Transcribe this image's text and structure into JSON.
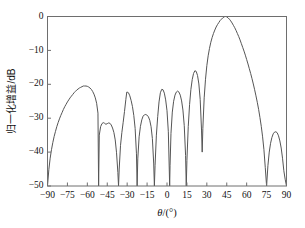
{
  "chart_data": {
    "type": "line",
    "title": "",
    "subtitle": "",
    "xlabel": "θ/(°)",
    "ylabel": "归一化增益/dB",
    "xlim": [
      -90,
      90
    ],
    "ylim": [
      -50,
      0
    ],
    "xticks": [
      -90,
      -75,
      -60,
      -45,
      -30,
      -15,
      0,
      15,
      30,
      45,
      60,
      75,
      90
    ],
    "xticklabels": [
      "−90",
      "−75",
      "−60",
      "−45",
      "−30",
      "−15",
      "0",
      "15",
      "30",
      "45",
      "60",
      "75",
      "90"
    ],
    "yticks": [
      0,
      -10,
      -20,
      -30,
      -40,
      -50
    ],
    "yticklabels": [
      "0",
      "−10",
      "−20",
      "−30",
      "−40",
      "−50"
    ],
    "grid": false,
    "legend": null,
    "line_color": "#555555",
    "axis_color": "#6e6e6e",
    "background": "#ffffff",
    "series": [
      {
        "name": "normalized gain pattern",
        "main_lobe": {
          "peak_x": 43,
          "peak_y": 0,
          "left_null_x": 28,
          "right_null_x": 75
        },
        "sidelobe_peaks": [
          {
            "x": -63,
            "y": -20.5
          },
          {
            "x": -43,
            "y": -31.5
          },
          {
            "x": -30,
            "y": -22.3
          },
          {
            "x": -15.5,
            "y": -29.0
          },
          {
            "x": -4,
            "y": -21.5
          },
          {
            "x": 8,
            "y": -22.0
          },
          {
            "x": 21,
            "y": -16.0
          },
          {
            "x": 82,
            "y": -34.0
          }
        ],
        "nulls": [
          {
            "x": -90,
            "y": -50
          },
          {
            "x": -51.5,
            "y": -50
          },
          {
            "x": -36.5,
            "y": -50
          },
          {
            "x": -22.5,
            "y": -50
          },
          {
            "x": -9.5,
            "y": -50
          },
          {
            "x": 2.0,
            "y": -50
          },
          {
            "x": 14.5,
            "y": -50
          },
          {
            "x": 26.5,
            "y": -40.0
          },
          {
            "x": 75.0,
            "y": -50
          },
          {
            "x": 90.0,
            "y": -50
          }
        ],
        "points": [
          [
            -90,
            -50.0
          ],
          [
            -89,
            -45.2
          ],
          [
            -88,
            -41.8
          ],
          [
            -87,
            -39.3
          ],
          [
            -86,
            -37.2
          ],
          [
            -85,
            -35.4
          ],
          [
            -84,
            -33.9
          ],
          [
            -83,
            -32.5
          ],
          [
            -82,
            -31.3
          ],
          [
            -81,
            -30.2
          ],
          [
            -80,
            -29.2
          ],
          [
            -79,
            -28.3
          ],
          [
            -78,
            -27.4
          ],
          [
            -77,
            -26.6
          ],
          [
            -76,
            -25.9
          ],
          [
            -75,
            -25.2
          ],
          [
            -74,
            -24.6
          ],
          [
            -73,
            -24.0
          ],
          [
            -72,
            -23.5
          ],
          [
            -71,
            -23.0
          ],
          [
            -70,
            -22.5
          ],
          [
            -69,
            -22.1
          ],
          [
            -68,
            -21.7
          ],
          [
            -67,
            -21.4
          ],
          [
            -66,
            -21.1
          ],
          [
            -65,
            -20.9
          ],
          [
            -64,
            -20.7
          ],
          [
            -63,
            -20.5
          ],
          [
            -62,
            -20.5
          ],
          [
            -61,
            -20.5
          ],
          [
            -60,
            -20.6
          ],
          [
            -59,
            -20.8
          ],
          [
            -58,
            -21.1
          ],
          [
            -57,
            -21.5
          ],
          [
            -56,
            -22.1
          ],
          [
            -55,
            -22.9
          ],
          [
            -54,
            -24.0
          ],
          [
            -53,
            -25.6
          ],
          [
            -52,
            -28.5
          ],
          [
            -51.5,
            -50.0
          ],
          [
            -51,
            -35.0
          ],
          [
            -50,
            -32.5
          ],
          [
            -49,
            -31.6
          ],
          [
            -48,
            -31.3
          ],
          [
            -47,
            -31.5
          ],
          [
            -46,
            -31.8
          ],
          [
            -45,
            -31.6
          ],
          [
            -44,
            -31.4
          ],
          [
            -43,
            -31.5
          ],
          [
            -42,
            -32.0
          ],
          [
            -41,
            -32.9
          ],
          [
            -40,
            -34.2
          ],
          [
            -39,
            -36.4
          ],
          [
            -38,
            -40.2
          ],
          [
            -37,
            -46.0
          ],
          [
            -36.5,
            -50.0
          ],
          [
            -36,
            -45.0
          ],
          [
            -35,
            -38.0
          ],
          [
            -34,
            -34.2
          ],
          [
            -33,
            -31.2
          ],
          [
            -32,
            -28.0
          ],
          [
            -31,
            -24.5
          ],
          [
            -30.3,
            -22.3
          ],
          [
            -30,
            -22.3
          ],
          [
            -29,
            -22.5
          ],
          [
            -28,
            -23.4
          ],
          [
            -27,
            -24.8
          ],
          [
            -26,
            -26.6
          ],
          [
            -25,
            -29.2
          ],
          [
            -24,
            -33.0
          ],
          [
            -23,
            -40.5
          ],
          [
            -22.5,
            -50.0
          ],
          [
            -22,
            -42.0
          ],
          [
            -21,
            -35.5
          ],
          [
            -20,
            -32.4
          ],
          [
            -19,
            -30.5
          ],
          [
            -18,
            -29.4
          ],
          [
            -17,
            -29.0
          ],
          [
            -16,
            -28.9
          ],
          [
            -15.5,
            -29.0
          ],
          [
            -15,
            -29.1
          ],
          [
            -14,
            -29.6
          ],
          [
            -13,
            -30.6
          ],
          [
            -12,
            -32.5
          ],
          [
            -11,
            -36.0
          ],
          [
            -10,
            -43.5
          ],
          [
            -9.5,
            -50.0
          ],
          [
            -9,
            -44.0
          ],
          [
            -8,
            -35.0
          ],
          [
            -7,
            -29.5
          ],
          [
            -6,
            -25.2
          ],
          [
            -5,
            -22.5
          ],
          [
            -4,
            -21.5
          ],
          [
            -3,
            -21.6
          ],
          [
            -2,
            -22.6
          ],
          [
            -1,
            -24.6
          ],
          [
            0,
            -27.8
          ],
          [
            1,
            -34.0
          ],
          [
            1.7,
            -45.0
          ],
          [
            2.0,
            -50.0
          ],
          [
            2.3,
            -44.0
          ],
          [
            3,
            -34.5
          ],
          [
            4,
            -28.2
          ],
          [
            5,
            -25.0
          ],
          [
            6,
            -23.2
          ],
          [
            7,
            -22.3
          ],
          [
            8,
            -22.0
          ],
          [
            9,
            -22.3
          ],
          [
            10,
            -23.2
          ],
          [
            11,
            -24.9
          ],
          [
            12,
            -27.6
          ],
          [
            13,
            -32.2
          ],
          [
            14,
            -41.0
          ],
          [
            14.5,
            -50.0
          ],
          [
            15,
            -42.5
          ],
          [
            16,
            -32.5
          ],
          [
            17,
            -26.0
          ],
          [
            18,
            -21.5
          ],
          [
            19,
            -18.6
          ],
          [
            20,
            -16.8
          ],
          [
            21,
            -16.0
          ],
          [
            22,
            -16.2
          ],
          [
            23,
            -17.4
          ],
          [
            24,
            -19.9
          ],
          [
            25,
            -24.5
          ],
          [
            26,
            -33.5
          ],
          [
            26.5,
            -40.0
          ],
          [
            27,
            -33.0
          ],
          [
            28,
            -24.0
          ],
          [
            29,
            -18.5
          ],
          [
            30,
            -14.5
          ],
          [
            31,
            -11.6
          ],
          [
            32,
            -9.4
          ],
          [
            33,
            -7.6
          ],
          [
            34,
            -6.2
          ],
          [
            35,
            -5.0
          ],
          [
            36,
            -4.0
          ],
          [
            37,
            -3.1
          ],
          [
            38,
            -2.4
          ],
          [
            39,
            -1.8
          ],
          [
            40,
            -1.2
          ],
          [
            41,
            -0.8
          ],
          [
            42,
            -0.4
          ],
          [
            43,
            -0.1
          ],
          [
            44,
            0.0
          ],
          [
            45,
            -0.1
          ],
          [
            46,
            -0.4
          ],
          [
            47,
            -0.8
          ],
          [
            48,
            -1.3
          ],
          [
            49,
            -1.9
          ],
          [
            50,
            -2.6
          ],
          [
            51,
            -3.3
          ],
          [
            52,
            -4.1
          ],
          [
            53,
            -5.0
          ],
          [
            54,
            -5.9
          ],
          [
            55,
            -6.9
          ],
          [
            56,
            -8.0
          ],
          [
            57,
            -9.1
          ],
          [
            58,
            -10.2
          ],
          [
            59,
            -11.4
          ],
          [
            60,
            -12.7
          ],
          [
            61,
            -14.0
          ],
          [
            62,
            -15.4
          ],
          [
            63,
            -16.8
          ],
          [
            64,
            -18.3
          ],
          [
            65,
            -19.9
          ],
          [
            66,
            -21.6
          ],
          [
            67,
            -23.4
          ],
          [
            68,
            -25.3
          ],
          [
            69,
            -27.4
          ],
          [
            70,
            -29.8
          ],
          [
            71,
            -32.4
          ],
          [
            72,
            -35.5
          ],
          [
            73,
            -39.3
          ],
          [
            74,
            -44.5
          ],
          [
            75,
            -50.0
          ],
          [
            76,
            -44.0
          ],
          [
            77,
            -40.0
          ],
          [
            78,
            -37.4
          ],
          [
            79,
            -35.7
          ],
          [
            80,
            -34.6
          ],
          [
            81,
            -34.1
          ],
          [
            82,
            -34.0
          ],
          [
            83,
            -34.3
          ],
          [
            84,
            -35.2
          ],
          [
            85,
            -36.7
          ],
          [
            86,
            -38.8
          ],
          [
            87,
            -41.8
          ],
          [
            88,
            -45.5
          ],
          [
            89,
            -48.0
          ],
          [
            90,
            -50.0
          ]
        ]
      }
    ]
  },
  "figure": {
    "axis_title_x": "θ/(°)",
    "axis_title_x_symbol": "θ",
    "axis_title_x_unit": "/(°)",
    "axis_title_y": "归一化增益/dB"
  }
}
